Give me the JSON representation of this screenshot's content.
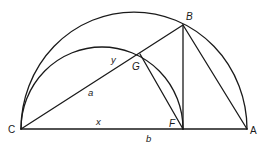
{
  "diagram": {
    "type": "geometric-construction",
    "points": {
      "C": {
        "label": "C",
        "x": 21,
        "y": 129
      },
      "A": {
        "label": "A",
        "x": 247,
        "y": 129
      },
      "F": {
        "label": "F",
        "x": 183,
        "y": 129
      },
      "B": {
        "label": "B",
        "x": 183,
        "y": 25
      },
      "G": {
        "label": "G",
        "x": 140,
        "y": 54
      }
    },
    "segment_labels": {
      "a": "a",
      "y": "y",
      "x": "x",
      "b": "b"
    },
    "arcs": [
      {
        "name": "large-semicircle",
        "from": "C",
        "to": "A",
        "diameter": "CA"
      },
      {
        "name": "small-semicircle",
        "from": "C",
        "to": "F",
        "diameter": "CF"
      }
    ],
    "segments": [
      "CA",
      "CB",
      "BF",
      "BA",
      "GF"
    ],
    "stroke_color": "#1a1a1a",
    "background": "#ffffff"
  }
}
